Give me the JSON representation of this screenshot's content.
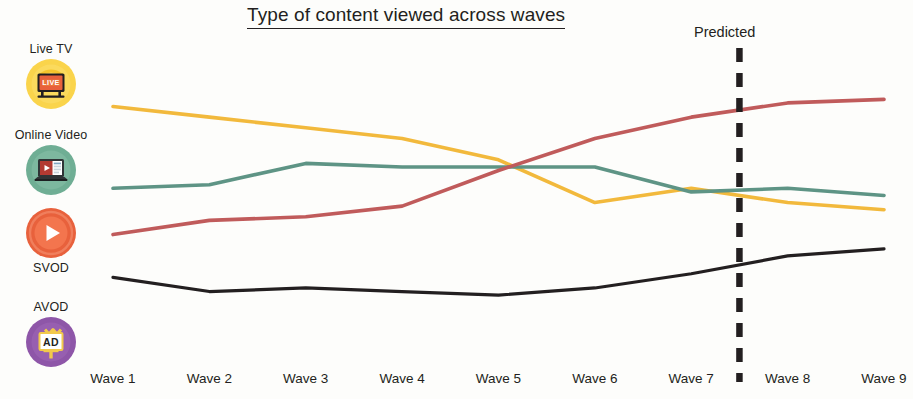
{
  "chart_title": "Type of content viewed across waves",
  "annotation": {
    "predicted_label": "Predicted",
    "divider_x_wave": 7.5
  },
  "legend": {
    "items": [
      {
        "label": "Live TV",
        "icon": "live-tv-icon",
        "color": "#F2B93C",
        "label_position": "above"
      },
      {
        "label": "Online Video",
        "icon": "online-video-icon",
        "color": "#6FAE94",
        "label_position": "above"
      },
      {
        "label": "SVOD",
        "icon": "svod-play-icon",
        "color": "#E8613C",
        "label_position": "below"
      },
      {
        "label": "AVOD",
        "icon": "avod-billboard-icon",
        "color": "#8E56A8",
        "label_position": "below"
      }
    ]
  },
  "chart_data": {
    "type": "line",
    "title": "Type of content viewed across waves",
    "xlabel": "",
    "ylabel": "",
    "grid": false,
    "legend_position": "left",
    "categories": [
      "Wave 1",
      "Wave 2",
      "Wave 3",
      "Wave 4",
      "Wave 5",
      "Wave 6",
      "Wave 7",
      "Wave 8",
      "Wave 9"
    ],
    "ylim": [
      0,
      100
    ],
    "annotations": [
      {
        "text": "Predicted",
        "type": "vertical-dashed-line",
        "between": [
          "Wave 7",
          "Wave 8"
        ]
      }
    ],
    "series": [
      {
        "name": "Live TV",
        "color": "#F2B93C",
        "line_color_hex": "#F2B93C",
        "values": [
          72,
          69,
          66,
          63,
          57,
          45,
          49,
          45,
          43
        ]
      },
      {
        "name": "Online Video",
        "color": "#5E9485",
        "line_color_hex": "#5E9485",
        "values": [
          49,
          50,
          56,
          55,
          55,
          55,
          48,
          49,
          47
        ]
      },
      {
        "name": "SVOD",
        "color": "#C05B5B",
        "line_color_hex": "#C05B5B",
        "values": [
          36,
          40,
          41,
          44,
          54,
          63,
          69,
          73,
          74
        ]
      },
      {
        "name": "AVOD",
        "color": "#231F20",
        "line_color_hex": "#231F20",
        "values": [
          24,
          20,
          21,
          20,
          19,
          21,
          25,
          30,
          32
        ]
      }
    ]
  }
}
